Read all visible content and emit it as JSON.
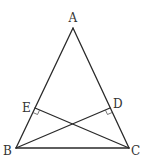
{
  "diagram": {
    "type": "geometry",
    "colors": {
      "line": "#2a2a2a",
      "marker": "#555555",
      "label": "#333333",
      "background": "#ffffff"
    },
    "points": {
      "A": {
        "label": "A",
        "x": 73,
        "y": 28
      },
      "B": {
        "label": "B",
        "x": 16,
        "y": 148
      },
      "C": {
        "label": "C",
        "x": 129,
        "y": 148
      },
      "D": {
        "label": "D",
        "x": 110,
        "y": 108
      },
      "E": {
        "label": "E",
        "x": 35,
        "y": 108
      }
    },
    "segments": [
      {
        "id": "AB",
        "from": "A",
        "to": "B"
      },
      {
        "id": "AC",
        "from": "A",
        "to": "C"
      },
      {
        "id": "BC",
        "from": "B",
        "to": "C"
      },
      {
        "id": "BD",
        "from": "B",
        "to": "D"
      },
      {
        "id": "CE",
        "from": "C",
        "to": "E"
      }
    ],
    "right_angles": [
      {
        "at": "E",
        "between": [
          "EC",
          "EB"
        ]
      },
      {
        "at": "D",
        "between": [
          "DB",
          "DC"
        ]
      }
    ]
  }
}
